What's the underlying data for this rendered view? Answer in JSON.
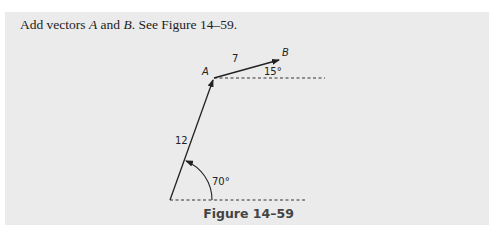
{
  "problem": {
    "prefix": "Add vectors ",
    "var_a": "A",
    "middle": " and ",
    "var_b": "B",
    "suffix": ". See Figure 14–59."
  },
  "figure": {
    "caption": "Figure 14–59",
    "vector_a": {
      "label": "A",
      "magnitude": "12",
      "angle": "70°"
    },
    "vector_b": {
      "label": "B",
      "magnitude": "7",
      "angle": "15°"
    }
  },
  "colors": {
    "panel": "#ebebeb",
    "ink": "#222222"
  }
}
